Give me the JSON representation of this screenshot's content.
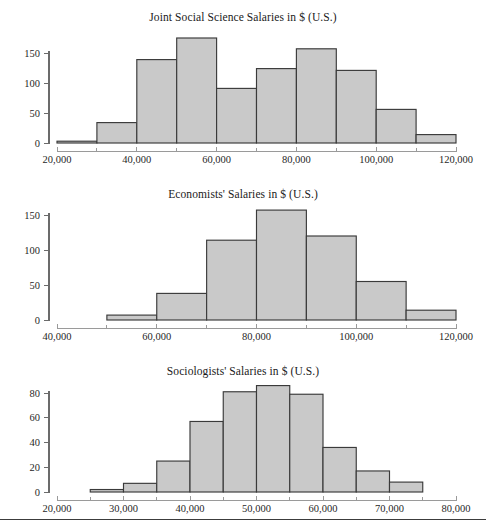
{
  "page": {
    "background": "#ffffff",
    "bar_fill": "#c9c9c9",
    "bar_stroke": "#3a3a3a",
    "axis_color": "#6b6b6b",
    "text_color": "#1f1f1f",
    "bottom_rule": true
  },
  "charts": [
    {
      "id": "joint-social-science-salaries",
      "title": "Joint Social Science Salaries in $ (U.S.)",
      "type": "bar",
      "xlabel": "",
      "ylabel": "",
      "xlim": [
        20000,
        120000
      ],
      "ylim": [
        0,
        180
      ],
      "bin_width": 10000,
      "grid": false,
      "legend": false,
      "x_ticks": [
        20000,
        30000,
        40000,
        50000,
        60000,
        70000,
        80000,
        90000,
        100000,
        110000,
        120000
      ],
      "x_tick_labels": [
        "20,000",
        "",
        "40,000",
        "",
        "60,000",
        "",
        "80,000",
        "",
        "100,000",
        "",
        "120,000"
      ],
      "y_ticks": [
        0,
        50,
        100,
        150
      ],
      "y_tick_labels": [
        "0",
        "50",
        "100",
        "150"
      ],
      "bin_starts": [
        20000,
        30000,
        40000,
        50000,
        60000,
        70000,
        80000,
        90000,
        100000,
        110000
      ],
      "categories": [
        "20,000-30,000",
        "30,000-40,000",
        "40,000-50,000",
        "50,000-60,000",
        "60,000-70,000",
        "70,000-80,000",
        "80,000-90,000",
        "90,000-100,000",
        "100,000-110,000",
        "110,000-120,000"
      ],
      "values": [
        3,
        34,
        139,
        175,
        91,
        124,
        157,
        121,
        56,
        14
      ]
    },
    {
      "id": "economists-salaries",
      "title": "Economists' Salaries in $ (U.S.)",
      "type": "bar",
      "xlabel": "",
      "ylabel": "",
      "xlim": [
        40000,
        120000
      ],
      "ylim": [
        0,
        165
      ],
      "bin_width": 10000,
      "grid": false,
      "legend": false,
      "x_ticks": [
        40000,
        50000,
        60000,
        70000,
        80000,
        90000,
        100000,
        110000,
        120000
      ],
      "x_tick_labels": [
        "40,000",
        "",
        "60,000",
        "",
        "80,000",
        "",
        "100,000",
        "",
        "120,000"
      ],
      "y_ticks": [
        0,
        50,
        100,
        150
      ],
      "y_tick_labels": [
        "0",
        "50",
        "100",
        "150"
      ],
      "bin_starts": [
        50000,
        60000,
        70000,
        80000,
        90000,
        100000,
        110000
      ],
      "categories": [
        "50,000-60,000",
        "60,000-70,000",
        "70,000-80,000",
        "80,000-90,000",
        "90,000-100,000",
        "100,000-110,000",
        "110,000-120,000"
      ],
      "values": [
        7,
        38,
        114,
        157,
        120,
        55,
        14
      ]
    },
    {
      "id": "sociologists-salaries",
      "title": "Sociologists' Salaries in $ (U.S.)",
      "type": "bar",
      "xlabel": "",
      "ylabel": "",
      "xlim": [
        20000,
        80000
      ],
      "ylim": [
        0,
        90
      ],
      "bin_width": 5000,
      "grid": false,
      "legend": false,
      "x_ticks": [
        20000,
        25000,
        30000,
        35000,
        40000,
        45000,
        50000,
        55000,
        60000,
        65000,
        70000,
        75000,
        80000
      ],
      "x_tick_labels": [
        "20,000",
        "",
        "30,000",
        "",
        "40,000",
        "",
        "50,000",
        "",
        "60,000",
        "",
        "70,000",
        "",
        "80,000"
      ],
      "y_ticks": [
        0,
        20,
        40,
        60,
        80
      ],
      "y_tick_labels": [
        "0",
        "20",
        "40",
        "60",
        "80"
      ],
      "bin_starts": [
        25000,
        30000,
        35000,
        40000,
        45000,
        50000,
        55000,
        60000,
        65000,
        70000
      ],
      "categories": [
        "25,000-30,000",
        "30,000-35,000",
        "35,000-40,000",
        "40,000-45,000",
        "45,000-50,000",
        "50,000-55,000",
        "55,000-60,000",
        "60,000-65,000",
        "65,000-70,000",
        "70,000-75,000"
      ],
      "values": [
        2,
        7,
        25,
        57,
        81,
        86,
        79,
        36,
        17,
        8
      ]
    }
  ],
  "chart_data": [
    {
      "type": "bar",
      "title": "Joint Social Science Salaries in $ (U.S.)",
      "xlabel": "",
      "ylabel": "",
      "xlim": [
        20000,
        120000
      ],
      "ylim": [
        0,
        180
      ],
      "grid": false,
      "legend": false,
      "categories": [
        "20,000-30,000",
        "30,000-40,000",
        "40,000-50,000",
        "50,000-60,000",
        "60,000-70,000",
        "70,000-80,000",
        "80,000-90,000",
        "90,000-100,000",
        "100,000-110,000",
        "110,000-120,000"
      ],
      "values": [
        3,
        34,
        139,
        175,
        91,
        124,
        157,
        121,
        56,
        14
      ],
      "xtick_labels": [
        "20,000",
        "40,000",
        "60,000",
        "80,000",
        "100,000",
        "120,000"
      ],
      "ytick_labels": [
        "0",
        "50",
        "100",
        "150"
      ]
    },
    {
      "type": "bar",
      "title": "Economists' Salaries in $ (U.S.)",
      "xlabel": "",
      "ylabel": "",
      "xlim": [
        40000,
        120000
      ],
      "ylim": [
        0,
        165
      ],
      "grid": false,
      "legend": false,
      "categories": [
        "50,000-60,000",
        "60,000-70,000",
        "70,000-80,000",
        "80,000-90,000",
        "90,000-100,000",
        "100,000-110,000",
        "110,000-120,000"
      ],
      "values": [
        7,
        38,
        114,
        157,
        120,
        55,
        14
      ],
      "xtick_labels": [
        "40,000",
        "60,000",
        "80,000",
        "100,000",
        "120,000"
      ],
      "ytick_labels": [
        "0",
        "50",
        "100",
        "150"
      ]
    },
    {
      "type": "bar",
      "title": "Sociologists' Salaries in $ (U.S.)",
      "xlabel": "",
      "ylabel": "",
      "xlim": [
        20000,
        80000
      ],
      "ylim": [
        0,
        90
      ],
      "grid": false,
      "legend": false,
      "categories": [
        "25,000-30,000",
        "30,000-35,000",
        "35,000-40,000",
        "40,000-45,000",
        "45,000-50,000",
        "50,000-55,000",
        "55,000-60,000",
        "60,000-65,000",
        "65,000-70,000",
        "70,000-75,000"
      ],
      "values": [
        2,
        7,
        25,
        57,
        81,
        86,
        79,
        36,
        17,
        8
      ],
      "xtick_labels": [
        "20,000",
        "30,000",
        "40,000",
        "50,000",
        "60,000",
        "70,000",
        "80,000"
      ],
      "ytick_labels": [
        "0",
        "20",
        "40",
        "60",
        "80"
      ]
    }
  ]
}
